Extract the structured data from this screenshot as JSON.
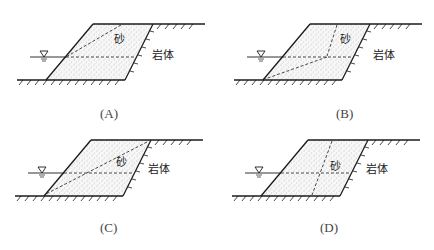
{
  "figure": {
    "panels": [
      {
        "id": "A",
        "caption": "(A)",
        "sand_label": "砂",
        "rock_label": "岩体",
        "slip_surface": "planar-diagonal-from-top-middle-to-waterline-at-slope",
        "has_water_table": true
      },
      {
        "id": "B",
        "caption": "(B)",
        "sand_label": "砂",
        "rock_label": "岩体",
        "slip_surface": "broken-line: vertical-from-top then diagonal-to-toe",
        "has_water_table": true
      },
      {
        "id": "C",
        "caption": "(C)",
        "sand_label": "砂",
        "rock_label": "岩体",
        "slip_surface": "planar-diagonal-from-top-right-to-toe",
        "has_water_table": true
      },
      {
        "id": "D",
        "caption": "(D)",
        "sand_label": "砂",
        "rock_label": "岩体",
        "slip_surface": "near-vertical-from-top-to-base",
        "has_water_table": true
      }
    ],
    "water_symbol": "water-table-triangle-icon",
    "colors": {
      "line": "#1a1a1a",
      "dash": "#333333",
      "sand_dots": "#777777",
      "text": "#222222"
    }
  }
}
